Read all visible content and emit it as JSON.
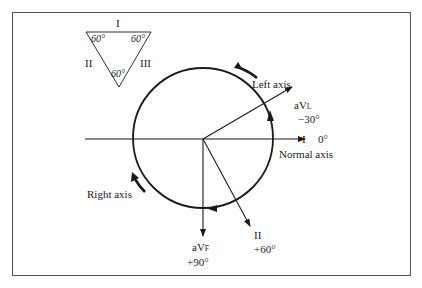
{
  "diagram": {
    "type": "hexaxial-reference-diagram",
    "colors": {
      "line": "#1a1a1a",
      "frame": "#555555",
      "background": "#ffffff"
    },
    "triangle": {
      "side_labels": {
        "top": "I",
        "left": "II",
        "right": "III"
      },
      "angles": {
        "top_left": "60°",
        "top_right": "60°",
        "bottom": "60°"
      }
    },
    "axes": {
      "lead_I": {
        "name": "I",
        "angle": "0°"
      },
      "lead_aVL": {
        "name_prefix": "aV",
        "name_sub": "L",
        "angle": "−30°"
      },
      "lead_II": {
        "name": "II",
        "angle": "+60°"
      },
      "lead_aVF": {
        "name_prefix": "aV",
        "name_sub": "F",
        "angle": "+90°"
      }
    },
    "regions": {
      "left_axis": "Left axis",
      "normal_axis": "Normal axis",
      "right_axis": "Right axis"
    }
  }
}
